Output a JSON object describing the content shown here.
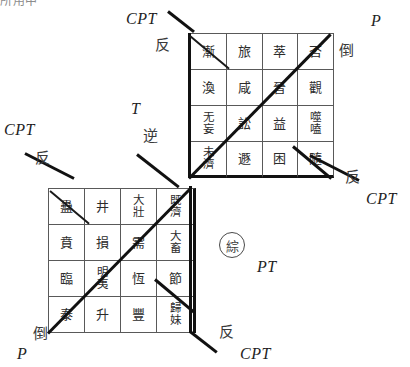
{
  "figure": {
    "top_remnant": "所用中",
    "center_marker": "綜"
  },
  "grids": {
    "upper": {
      "name": "upper-right-hexagram-grid",
      "rows": [
        [
          "漸",
          "旅",
          "萃",
          "否"
        ],
        [
          "渙",
          "咸",
          "晉",
          "觀"
        ],
        [
          "无妄",
          "訟",
          "益",
          "噬嗑"
        ],
        [
          "未濟",
          "遯",
          "困",
          "隨"
        ]
      ]
    },
    "lower": {
      "name": "lower-left-hexagram-grid",
      "rows": [
        [
          "蠱",
          "井",
          "大壯",
          "既濟"
        ],
        [
          "賁",
          "損",
          "需",
          "大畜"
        ],
        [
          "臨",
          "明夷",
          "恆",
          "節"
        ],
        [
          "泰",
          "升",
          "豐",
          "歸妹"
        ]
      ]
    }
  },
  "labels": {
    "top_left_cpt": "CPT",
    "top_left_fan": "反",
    "top_right_p": "P",
    "top_right_dao": "倒",
    "mid_left_cpt": "CPT",
    "mid_left_fan": "反",
    "center_t": "T",
    "center_ni": "逆",
    "right_fan": "反",
    "right_cpt": "CPT",
    "center_pt": "PT",
    "bottom_left_dao": "倒",
    "bottom_left_p": "P",
    "bottom_right_fan": "反",
    "bottom_right_cpt": "CPT"
  },
  "colors": {
    "ink": "#111111",
    "grid_line": "#595959",
    "text": "#2b2b2b"
  }
}
